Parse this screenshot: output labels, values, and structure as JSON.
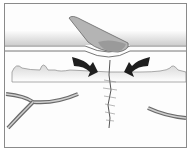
{
  "illustration": {
    "subject": "wound healing - scab over closing skin wound",
    "elements": [
      "scab",
      "skin-surface",
      "dermis-edge",
      "closing-arrows",
      "wound-line",
      "blood-vessel-left",
      "blood-vessel-right"
    ]
  },
  "colors": {
    "frame": "#8a8a8a",
    "scab": "#a8a8a8",
    "scab_dark": "#7a7a7a",
    "skin_band": "#d6d6d6",
    "arrow": "#1e1e1e",
    "vessel": "#6a6a6a"
  }
}
